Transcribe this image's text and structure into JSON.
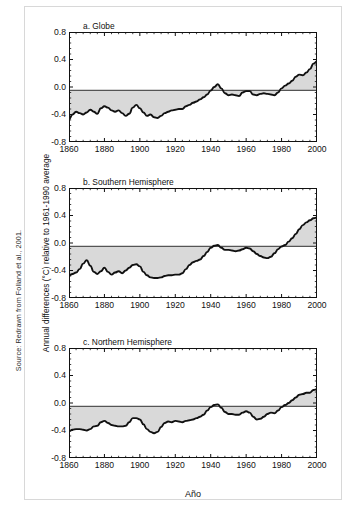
{
  "figure": {
    "source_note": "Source: Redrawn from Folland et al., 2001.",
    "y_axis_label": "Annual differences (°C) relative to 1961-1990 average",
    "x_axis_label": "Año",
    "colors": {
      "line": "#111111",
      "fill": "#d9d9d9",
      "axis": "#111111",
      "frame": "#d8d8d8",
      "zero_line": "#555555"
    }
  },
  "chart_data": [
    {
      "type": "area",
      "title": "a. Globe",
      "xlabel": "",
      "ylabel": "Annual differences (°C) relative to 1961-1990 average",
      "xlim": [
        1860,
        2000
      ],
      "ylim": [
        -0.8,
        0.8
      ],
      "xticks": [
        1860,
        1880,
        1900,
        1920,
        1940,
        1960,
        1980,
        2000
      ],
      "yticks": [
        0.8,
        0.4,
        0.0,
        -0.4,
        -0.8
      ],
      "ytick_labels": [
        "0.8",
        "0.4",
        "0.0",
        "-0.4",
        "-0.8"
      ],
      "xtick_labels": [
        "1860",
        "1880",
        "1900",
        "1920",
        "1940",
        "1960",
        "1980",
        "2000"
      ],
      "grid": false,
      "baseline": -0.05,
      "minor_ticks_x": 4,
      "minor_ticks_y": 4,
      "x": [
        1860,
        1862,
        1864,
        1866,
        1868,
        1870,
        1872,
        1874,
        1876,
        1878,
        1880,
        1882,
        1884,
        1886,
        1888,
        1890,
        1892,
        1894,
        1896,
        1898,
        1900,
        1902,
        1904,
        1906,
        1908,
        1910,
        1912,
        1914,
        1916,
        1918,
        1920,
        1922,
        1924,
        1926,
        1928,
        1930,
        1932,
        1934,
        1936,
        1938,
        1940,
        1942,
        1944,
        1946,
        1948,
        1950,
        1952,
        1954,
        1956,
        1958,
        1960,
        1962,
        1964,
        1966,
        1968,
        1970,
        1972,
        1974,
        1976,
        1978,
        1980,
        1982,
        1984,
        1986,
        1988,
        1990,
        1992,
        1994,
        1996,
        1998,
        2000
      ],
      "values": [
        -0.47,
        -0.4,
        -0.36,
        -0.38,
        -0.4,
        -0.37,
        -0.33,
        -0.36,
        -0.39,
        -0.31,
        -0.28,
        -0.3,
        -0.34,
        -0.36,
        -0.34,
        -0.38,
        -0.42,
        -0.39,
        -0.3,
        -0.26,
        -0.31,
        -0.37,
        -0.42,
        -0.4,
        -0.44,
        -0.45,
        -0.42,
        -0.38,
        -0.36,
        -0.34,
        -0.33,
        -0.32,
        -0.32,
        -0.28,
        -0.26,
        -0.23,
        -0.21,
        -0.18,
        -0.15,
        -0.11,
        -0.05,
        0.0,
        0.04,
        -0.02,
        -0.09,
        -0.12,
        -0.11,
        -0.12,
        -0.13,
        -0.08,
        -0.06,
        -0.06,
        -0.11,
        -0.12,
        -0.1,
        -0.09,
        -0.1,
        -0.11,
        -0.12,
        -0.08,
        -0.02,
        0.02,
        0.05,
        0.09,
        0.15,
        0.18,
        0.17,
        0.21,
        0.26,
        0.34,
        0.37
      ]
    },
    {
      "type": "area",
      "title": "b. Southern Hemisphere",
      "xlabel": "",
      "ylabel": "Annual differences (°C) relative to 1961-1990 average",
      "xlim": [
        1860,
        2000
      ],
      "ylim": [
        -0.8,
        0.8
      ],
      "xticks": [
        1860,
        1880,
        1900,
        1920,
        1940,
        1960,
        1980,
        2000
      ],
      "yticks": [
        0.8,
        0.4,
        0.0,
        -0.4,
        -0.8
      ],
      "ytick_labels": [
        "0.8",
        "0.4",
        "0.0",
        "-0.4",
        "-0.8"
      ],
      "xtick_labels": [
        "1860",
        "1880",
        "1900",
        "1920",
        "1940",
        "1960",
        "1980",
        "2000"
      ],
      "grid": false,
      "baseline": -0.05,
      "minor_ticks_x": 4,
      "minor_ticks_y": 4,
      "x": [
        1860,
        1862,
        1864,
        1866,
        1868,
        1870,
        1872,
        1874,
        1876,
        1878,
        1880,
        1882,
        1884,
        1886,
        1888,
        1890,
        1892,
        1894,
        1896,
        1898,
        1900,
        1902,
        1904,
        1906,
        1908,
        1910,
        1912,
        1914,
        1916,
        1918,
        1920,
        1922,
        1924,
        1926,
        1928,
        1930,
        1932,
        1934,
        1936,
        1938,
        1940,
        1942,
        1944,
        1946,
        1948,
        1950,
        1952,
        1954,
        1956,
        1958,
        1960,
        1962,
        1964,
        1966,
        1968,
        1970,
        1972,
        1974,
        1976,
        1978,
        1980,
        1982,
        1984,
        1986,
        1988,
        1990,
        1992,
        1994,
        1996,
        1998,
        2000
      ],
      "values": [
        -0.47,
        -0.45,
        -0.43,
        -0.38,
        -0.3,
        -0.25,
        -0.33,
        -0.42,
        -0.45,
        -0.41,
        -0.36,
        -0.42,
        -0.46,
        -0.43,
        -0.41,
        -0.44,
        -0.4,
        -0.36,
        -0.32,
        -0.31,
        -0.34,
        -0.42,
        -0.47,
        -0.5,
        -0.51,
        -0.51,
        -0.5,
        -0.48,
        -0.47,
        -0.47,
        -0.46,
        -0.46,
        -0.44,
        -0.38,
        -0.32,
        -0.28,
        -0.26,
        -0.24,
        -0.19,
        -0.13,
        -0.07,
        -0.04,
        -0.03,
        -0.07,
        -0.1,
        -0.1,
        -0.11,
        -0.12,
        -0.11,
        -0.09,
        -0.07,
        -0.08,
        -0.12,
        -0.16,
        -0.19,
        -0.21,
        -0.22,
        -0.2,
        -0.15,
        -0.09,
        -0.05,
        -0.03,
        0.02,
        0.07,
        0.13,
        0.2,
        0.26,
        0.3,
        0.33,
        0.36,
        0.37
      ]
    },
    {
      "type": "area",
      "title": "c. Northern Hemisphere",
      "xlabel": "Año",
      "ylabel": "Annual differences (°C) relative to 1961-1990 average",
      "xlim": [
        1860,
        2000
      ],
      "ylim": [
        -0.8,
        0.8
      ],
      "xticks": [
        1860,
        1880,
        1900,
        1920,
        1940,
        1960,
        1980,
        2000
      ],
      "yticks": [
        0.8,
        0.4,
        0.0,
        -0.4,
        -0.8
      ],
      "ytick_labels": [
        "0.8",
        "0.4",
        "0.0",
        "-0.4",
        "-0.8"
      ],
      "xtick_labels": [
        "1860",
        "1880",
        "1900",
        "1920",
        "1940",
        "1960",
        "1980",
        "2000"
      ],
      "grid": false,
      "baseline": -0.05,
      "minor_ticks_x": 4,
      "minor_ticks_y": 4,
      "x": [
        1860,
        1862,
        1864,
        1866,
        1868,
        1870,
        1872,
        1874,
        1876,
        1878,
        1880,
        1882,
        1884,
        1886,
        1888,
        1890,
        1892,
        1894,
        1896,
        1898,
        1900,
        1902,
        1904,
        1906,
        1908,
        1910,
        1912,
        1914,
        1916,
        1918,
        1920,
        1922,
        1924,
        1926,
        1928,
        1930,
        1932,
        1934,
        1936,
        1938,
        1940,
        1942,
        1944,
        1946,
        1948,
        1950,
        1952,
        1954,
        1956,
        1958,
        1960,
        1962,
        1964,
        1966,
        1968,
        1970,
        1972,
        1974,
        1976,
        1978,
        1980,
        1982,
        1984,
        1986,
        1988,
        1990,
        1992,
        1994,
        1996,
        1998,
        2000
      ],
      "values": [
        -0.41,
        -0.39,
        -0.38,
        -0.38,
        -0.39,
        -0.4,
        -0.38,
        -0.34,
        -0.33,
        -0.28,
        -0.26,
        -0.29,
        -0.32,
        -0.33,
        -0.34,
        -0.34,
        -0.33,
        -0.28,
        -0.22,
        -0.22,
        -0.24,
        -0.31,
        -0.38,
        -0.42,
        -0.44,
        -0.42,
        -0.35,
        -0.29,
        -0.27,
        -0.28,
        -0.26,
        -0.27,
        -0.28,
        -0.26,
        -0.25,
        -0.24,
        -0.22,
        -0.2,
        -0.17,
        -0.11,
        -0.06,
        -0.03,
        -0.02,
        -0.07,
        -0.13,
        -0.16,
        -0.16,
        -0.17,
        -0.17,
        -0.14,
        -0.12,
        -0.14,
        -0.2,
        -0.24,
        -0.23,
        -0.2,
        -0.16,
        -0.14,
        -0.15,
        -0.11,
        -0.06,
        -0.03,
        0.0,
        0.04,
        0.08,
        0.12,
        0.13,
        0.15,
        0.15,
        0.19,
        0.2
      ]
    }
  ]
}
